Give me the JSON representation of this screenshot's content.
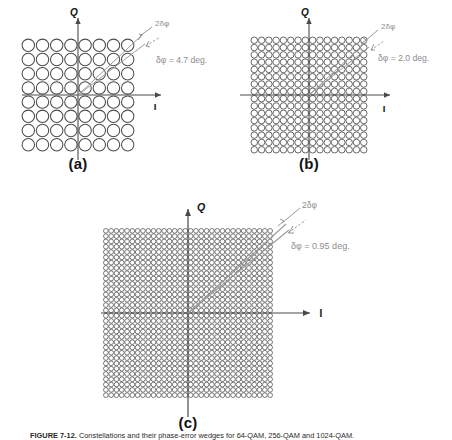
{
  "figure": {
    "caption_label": "FIGURE 7-12.",
    "caption_text": "Constellations and their phase-error wedges for 64-QAM, 256-QAM and 1024-QAM.",
    "background_color": "#ffffff",
    "circle_stroke_color": "#4d4d4d",
    "axis_color": "#4a4a4a",
    "annotation_color": "#8a8a8a",
    "label_color": "#111111"
  },
  "panels": [
    {
      "id": "a",
      "label": "(a)",
      "axis_q_label": "Q",
      "axis_i_label": "I",
      "wedge_label": "2δφ",
      "delta_label": "δφ = 4.7 deg.",
      "grid_cols": 8,
      "grid_rows": 8,
      "constellation_points": 64,
      "delta_phi_deg": 4.7
    },
    {
      "id": "b",
      "label": "(b)",
      "axis_q_label": "Q",
      "axis_i_label": "I",
      "wedge_label": "2δφ",
      "delta_label": "δφ = 2.0 deg.",
      "grid_cols": 16,
      "grid_rows": 16,
      "constellation_points": 256,
      "delta_phi_deg": 2.0
    },
    {
      "id": "c",
      "label": "(c)",
      "axis_q_label": "Q",
      "axis_i_label": "I",
      "wedge_label": "2δφ",
      "delta_label": "δφ = 0.95 deg.",
      "grid_cols": 32,
      "grid_rows": 32,
      "constellation_points": 1024,
      "delta_phi_deg": 0.95
    }
  ]
}
